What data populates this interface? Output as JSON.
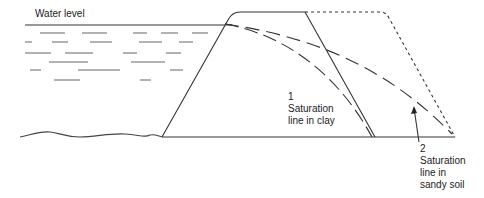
{
  "diagram": {
    "water_level_label": "Water level",
    "label_1_num": "1",
    "label_1_line1": "Saturation",
    "label_1_line2": "line in clay",
    "label_2_num": "2",
    "label_2_line1": "Saturation",
    "label_2_line2": "line in",
    "label_2_line3": "sandy soil"
  }
}
